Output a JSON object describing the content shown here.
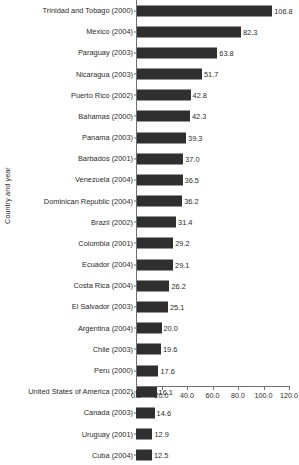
{
  "chart_data": {
    "type": "bar",
    "orientation": "horizontal",
    "title": "",
    "xlabel": "",
    "ylabel": "Country and year",
    "xlim": [
      0,
      120
    ],
    "xticks": [
      "0.0",
      "20.0",
      "40.0",
      "60.0",
      "80.0",
      "100.0",
      "120.0"
    ],
    "xtick_values": [
      0,
      20,
      40,
      60,
      80,
      100,
      120
    ],
    "grid": false,
    "legend": "none",
    "bar_color": "#2f2f2f",
    "axis_color": "#6f6f6f",
    "value_labels": true,
    "categories": [
      "Trinidad and Tobago (2000)",
      "Mexico (2004)",
      "Paraguay (2003)",
      "Nicaragua (2003)",
      "Puerto Rico (2002)",
      "Bahamas (2000)",
      "Panama (2003)",
      "Barbados (2001)",
      "Venezuela (2004)",
      "Dominican Republic (2004)",
      "Brazil (2002)",
      "Colombia (2001)",
      "Ecuador (2004)",
      "Costa Rica (2004)",
      "El Salvador (2003)",
      "Argentina (2004)",
      "Chile (2003)",
      "Peru (2000)",
      "United States of America (2002)",
      "Canada (2003)",
      "Uruguay (2001)",
      "Cuba (2004)"
    ],
    "values": [
      106.8,
      82.3,
      63.8,
      51.7,
      42.8,
      42.3,
      39.3,
      37.0,
      36.5,
      36.2,
      31.4,
      29.2,
      29.1,
      26.2,
      25.1,
      20.0,
      19.6,
      17.6,
      16.1,
      14.6,
      12.9,
      12.5
    ],
    "value_labels_text": [
      "106.8",
      "82.3",
      "63.8",
      "51.7",
      "42.8",
      "42.3",
      "39.3",
      "37.0",
      "36.5",
      "36.2",
      "31.4",
      "29.2",
      "29.1",
      "26.2",
      "25.1",
      "20.0",
      "19.6",
      "17.6",
      "16.1",
      "14.6",
      "12.9",
      "12.5"
    ]
  }
}
